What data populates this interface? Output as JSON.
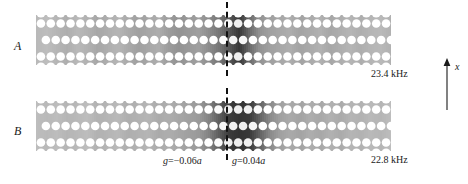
{
  "figure": {
    "type": "lattice-mode-map",
    "width": 468,
    "height": 184,
    "background": "#ffffff"
  },
  "panels": [
    {
      "id": "A",
      "label": "A",
      "frequency_label": "23.4 kHz",
      "frequency_value": 23.4,
      "frequency_unit": "kHz"
    },
    {
      "id": "B",
      "label": "B",
      "frequency_label": "22.8 kHz",
      "frequency_value": 22.8,
      "frequency_unit": "kHz"
    }
  ],
  "annotations": {
    "glide_left": {
      "symbol": "g",
      "equals": "=",
      "value": "−0.06",
      "unit": "a"
    },
    "glide_right": {
      "symbol": "g",
      "equals": "=",
      "value": "0.04",
      "unit": "a"
    }
  },
  "axis": {
    "label": "x",
    "direction": "up",
    "icon": "arrow-up-icon"
  },
  "divider": {
    "icon": "dashed-vertical-line",
    "style": "dashed",
    "color": "#111111"
  },
  "colors": {
    "lattice_fill": "#c9c9c9",
    "hole_fill": "#ffffff",
    "defect_dark": "#3a3a3a",
    "text": "#1a1a1a"
  },
  "chart_data": {
    "type": "heatmap",
    "title": "",
    "xlabel": "x",
    "ylabel": "",
    "panels": [
      {
        "name": "A",
        "frequency_khz": 23.4,
        "glide_marker": "g = −0.06a",
        "intensity_profile": [
          0.12,
          0.1,
          0.14,
          0.18,
          0.12,
          0.16,
          0.22,
          0.18,
          0.14,
          0.2,
          0.26,
          0.22,
          0.18,
          0.28,
          0.34,
          0.3,
          0.26,
          0.38,
          0.52,
          0.72,
          0.95,
          0.6,
          0.34,
          0.26,
          0.22,
          0.18,
          0.24,
          0.2,
          0.16,
          0.22,
          0.18,
          0.14,
          0.18,
          0.14,
          0.12,
          0.16
        ]
      },
      {
        "name": "B",
        "frequency_khz": 22.8,
        "glide_marker": "g = 0.04a",
        "intensity_profile": [
          0.1,
          0.12,
          0.1,
          0.14,
          0.12,
          0.1,
          0.16,
          0.14,
          0.12,
          0.18,
          0.16,
          0.14,
          0.2,
          0.18,
          0.22,
          0.26,
          0.3,
          0.44,
          0.68,
          0.92,
          0.98,
          0.94,
          0.66,
          0.4,
          0.26,
          0.2,
          0.24,
          0.18,
          0.22,
          0.16,
          0.2,
          0.14,
          0.16,
          0.12,
          0.14,
          0.1
        ]
      }
    ],
    "colorbar": {
      "min": 0,
      "max": 1,
      "colormap": "grayscale-inverted"
    }
  }
}
